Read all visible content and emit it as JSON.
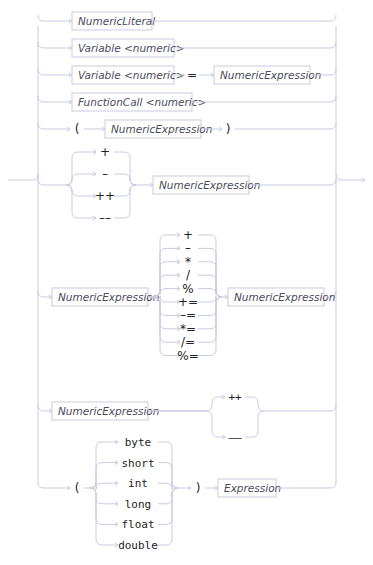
{
  "diagram": {
    "type": "railroad",
    "alternatives": [
      {
        "kind": "nonterminal",
        "items": [
          "NumericLiteral"
        ]
      },
      {
        "kind": "nonterminal",
        "items": [
          "Variable <numeric>"
        ]
      },
      {
        "kind": "sequence",
        "items": [
          "Variable <numeric>",
          "=",
          "NumericExpression"
        ]
      },
      {
        "kind": "nonterminal",
        "items": [
          "FunctionCall <numeric>"
        ]
      },
      {
        "kind": "sequence",
        "items": [
          "(",
          "NumericExpression",
          ")"
        ]
      },
      {
        "kind": "prefix",
        "operators": [
          "+",
          "–",
          "++",
          "––"
        ],
        "operand": "NumericExpression"
      },
      {
        "kind": "binary",
        "left": "NumericExpression",
        "operators": [
          "+",
          "–",
          "*",
          "/",
          "%",
          "+=",
          "–=",
          "*=",
          "/=",
          "%="
        ],
        "right": "NumericExpression"
      },
      {
        "kind": "postfix",
        "operand": "NumericExpression",
        "operators": [
          "++",
          "––"
        ]
      },
      {
        "kind": "cast",
        "open": "(",
        "types": [
          "byte",
          "short",
          "int",
          "long",
          "float",
          "double"
        ],
        "close": ")",
        "operand": "Expression"
      }
    ]
  }
}
